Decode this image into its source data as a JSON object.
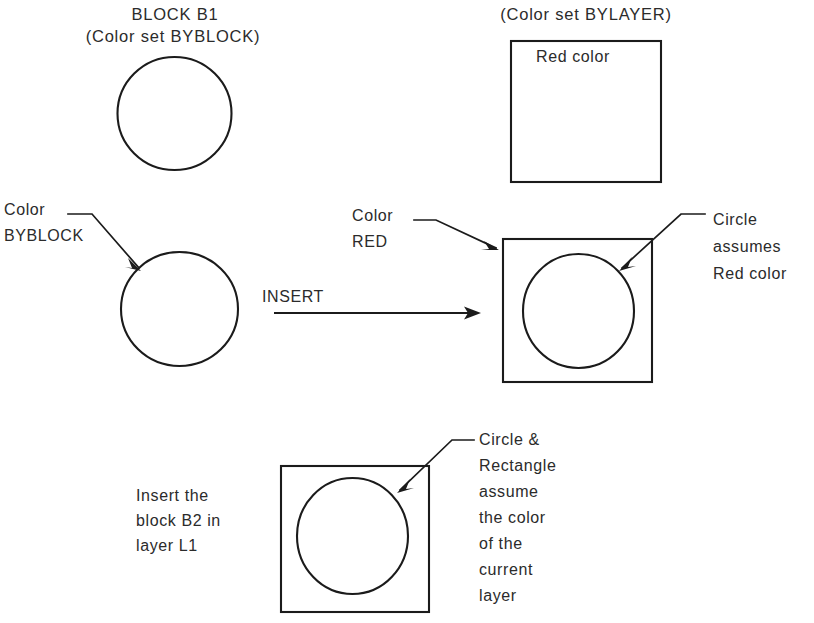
{
  "figure": {
    "background_color": "#ffffff",
    "ink_color": "#1b1b1b",
    "text_color": "#2b2b2b"
  },
  "panels": {
    "top_left": {
      "title_line1": "BLOCK B1",
      "title_line2": "(Color set BYBLOCK)",
      "shape": "circle"
    },
    "top_right": {
      "title": "(Color set BYLAYER)",
      "inner_label": "Red color",
      "shape": "rectangle"
    },
    "middle_left": {
      "callout_line1": "Color",
      "callout_line2": "BYBLOCK",
      "shape": "circle"
    },
    "middle_center": {
      "callout_line1": "Color",
      "callout_line2": "RED",
      "operation_label": "INSERT"
    },
    "middle_right": {
      "callout_line1": "Circle",
      "callout_line2": "assumes",
      "callout_line3": "Red color",
      "shape": "rectangle-with-circle"
    },
    "bottom_left": {
      "note_line1": "Insert the",
      "note_line2": "block B2 in",
      "note_line3": "layer L1"
    },
    "bottom_right": {
      "callout_line1": "Circle &",
      "callout_line2": "Rectangle",
      "callout_line3": "assume",
      "callout_line4": "the color",
      "callout_line5": "of the",
      "callout_line6": "current",
      "callout_line7": "layer",
      "shape": "rectangle-with-circle"
    }
  }
}
